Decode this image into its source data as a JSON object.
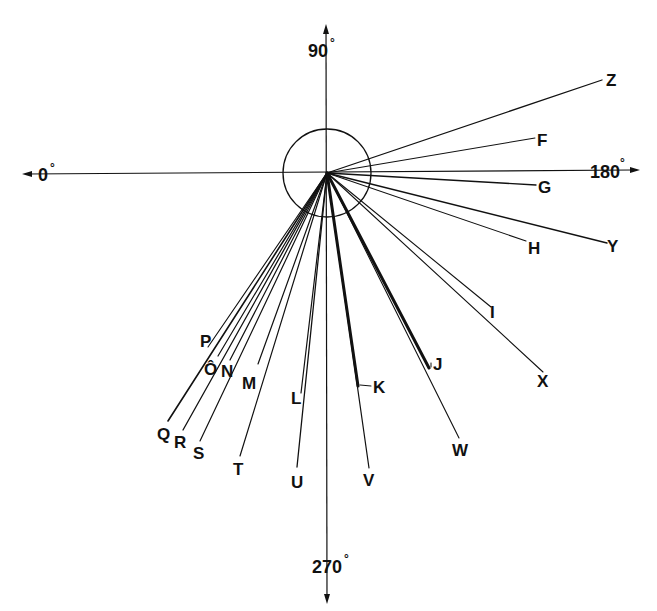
{
  "diagram": {
    "type": "polar-direction-diagram",
    "center": {
      "x": 327,
      "y": 173
    },
    "circle_radius": 44,
    "axes": {
      "left": {
        "label": "0",
        "unit": "°"
      },
      "top": {
        "label": "90",
        "unit": "°"
      },
      "right": {
        "label": "180",
        "unit": "°"
      },
      "bottom": {
        "label": "270",
        "unit": "°"
      }
    },
    "rays": [
      {
        "id": "Z",
        "label": "Z",
        "x": 602,
        "y": 80,
        "lx": 606,
        "ly": 86,
        "w": 1.3
      },
      {
        "id": "F",
        "label": "F",
        "x": 535,
        "y": 138,
        "lx": 537,
        "ly": 146,
        "w": 1.1
      },
      {
        "id": "G",
        "label": "G",
        "x": 536,
        "y": 185,
        "lx": 538,
        "ly": 193,
        "w": 1.3
      },
      {
        "id": "H",
        "label": "H",
        "x": 526,
        "y": 241,
        "lx": 528,
        "ly": 254,
        "w": 1.1
      },
      {
        "id": "Y",
        "label": "Y",
        "x": 607,
        "y": 243,
        "lx": 607,
        "ly": 252,
        "w": 1.3
      },
      {
        "id": "I",
        "label": "I",
        "x": 491,
        "y": 307,
        "lx": 490,
        "ly": 318,
        "w": 1.1
      },
      {
        "id": "X",
        "label": "X",
        "x": 543,
        "y": 372,
        "lx": 537,
        "ly": 387,
        "w": 1.1
      },
      {
        "id": "W",
        "label": "W",
        "x": 459,
        "y": 438,
        "lx": 452,
        "ly": 456,
        "w": 1.1
      },
      {
        "id": "V",
        "label": "V",
        "x": 369,
        "y": 468,
        "lx": 363,
        "ly": 486,
        "w": 1.2
      },
      {
        "id": "U",
        "label": "U",
        "x": 297,
        "y": 467,
        "lx": 291,
        "ly": 488,
        "w": 1.3
      },
      {
        "id": "L",
        "label": "L",
        "x": 301,
        "y": 393,
        "lx": 291,
        "ly": 404,
        "w": 1.2
      },
      {
        "id": "T",
        "label": "T",
        "x": 240,
        "y": 456,
        "lx": 233,
        "ly": 475,
        "w": 1.2
      },
      {
        "id": "M",
        "label": "M",
        "x": 258,
        "y": 364,
        "lx": 242,
        "ly": 389,
        "w": 1.2
      },
      {
        "id": "S",
        "label": "S",
        "x": 200,
        "y": 441,
        "lx": 193,
        "ly": 459,
        "w": 1.2
      },
      {
        "id": "N",
        "label": "N",
        "x": 230,
        "y": 360,
        "lx": 221,
        "ly": 377,
        "w": 1.2
      },
      {
        "id": "R",
        "label": "R",
        "x": 183,
        "y": 430,
        "lx": 174,
        "ly": 448,
        "w": 1.3
      },
      {
        "id": "O",
        "label": "Ô",
        "x": 218,
        "y": 356,
        "lx": 204,
        "ly": 375,
        "w": 1.2
      },
      {
        "id": "Q",
        "label": "Q",
        "x": 168,
        "y": 421,
        "lx": 157,
        "ly": 440,
        "w": 1.6
      },
      {
        "id": "P",
        "label": "P",
        "x": 208,
        "y": 347,
        "lx": 200,
        "ly": 347,
        "w": 1.1
      }
    ],
    "thick_segments": [
      {
        "id": "J",
        "label": "J",
        "x": 429,
        "y": 368,
        "lx": 433,
        "ly": 370,
        "w": 3,
        "arrow": true
      },
      {
        "id": "K",
        "label": "K",
        "x": 358,
        "y": 386,
        "lx": 373,
        "ly": 393,
        "w": 3,
        "arrow": true
      }
    ]
  }
}
